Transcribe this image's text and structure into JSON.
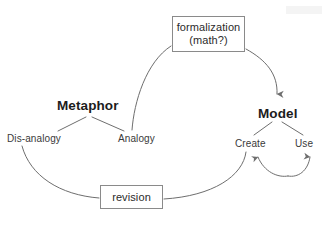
{
  "diagram": {
    "background_color": "#ffffff",
    "stroke_color": "#6e6e6e",
    "text_color": "#2b2b2b",
    "nodes": {
      "metaphor": {
        "label": "Metaphor",
        "style": "bold-heading"
      },
      "dis_analogy": {
        "label": "Dis-analogy",
        "style": "plain"
      },
      "analogy": {
        "label": "Analogy",
        "style": "plain"
      },
      "model": {
        "label": "Model",
        "style": "bold-heading"
      },
      "create": {
        "label": "Create",
        "style": "plain"
      },
      "use": {
        "label": "Use",
        "style": "plain"
      }
    },
    "boxes": {
      "formalization": {
        "line1": "formalization",
        "line2": "(math?)"
      },
      "revision": {
        "line1": "revision"
      }
    },
    "edges": [
      {
        "name": "metaphor-to-dis-analogy",
        "from": "metaphor",
        "to": "dis_analogy",
        "kind": "straight",
        "arrowhead": false
      },
      {
        "name": "metaphor-to-analogy",
        "from": "metaphor",
        "to": "analogy",
        "kind": "straight",
        "arrowhead": false
      },
      {
        "name": "analogy-to-formalization",
        "from": "analogy",
        "to": "formalization",
        "kind": "curve",
        "arrowhead": false
      },
      {
        "name": "formalization-to-model",
        "from": "formalization",
        "to": "model",
        "kind": "curve",
        "arrowhead": true
      },
      {
        "name": "model-to-create",
        "from": "model",
        "to": "create",
        "kind": "straight",
        "arrowhead": false
      },
      {
        "name": "model-to-use",
        "from": "model",
        "to": "use",
        "kind": "straight",
        "arrowhead": false
      },
      {
        "name": "create-use-loop",
        "from": "create",
        "to": "use",
        "kind": "u-curve",
        "arrowhead": true
      },
      {
        "name": "create-to-revision",
        "from": "create",
        "to": "revision",
        "kind": "curve",
        "arrowhead": false
      },
      {
        "name": "revision-to-dis-analogy",
        "from": "revision",
        "to": "dis_analogy",
        "kind": "curve",
        "arrowhead": false
      }
    ]
  }
}
